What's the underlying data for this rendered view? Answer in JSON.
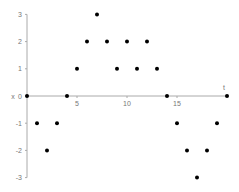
{
  "chart_data": {
    "type": "scatter",
    "title": "",
    "xlabel": "t",
    "ylabel": "x",
    "x": [
      0,
      1,
      2,
      3,
      4,
      5,
      6,
      7,
      8,
      9,
      10,
      11,
      12,
      13,
      14,
      15,
      16,
      17,
      18,
      19,
      20
    ],
    "series": [
      {
        "name": "x",
        "values": [
          0,
          -1,
          -2,
          -1,
          0,
          1,
          2,
          3,
          2,
          1,
          2,
          1,
          2,
          1,
          0,
          -1,
          -2,
          -3,
          -2,
          -1,
          0
        ]
      }
    ],
    "xticks": [
      "5",
      "10",
      "15"
    ],
    "xtick_values": [
      5,
      10,
      15
    ],
    "yticks": [
      "-3",
      "-2",
      "-1",
      "0",
      "1",
      "2",
      "3"
    ],
    "ytick_values": [
      -3,
      -2,
      -1,
      0,
      1,
      2,
      3
    ],
    "xlim": [
      0,
      20
    ],
    "ylim": [
      -3,
      3
    ],
    "grid": false,
    "legend": "none",
    "colors": {
      "marker": "#000000",
      "axis": "#aaaaaa",
      "text": "#777777"
    }
  }
}
